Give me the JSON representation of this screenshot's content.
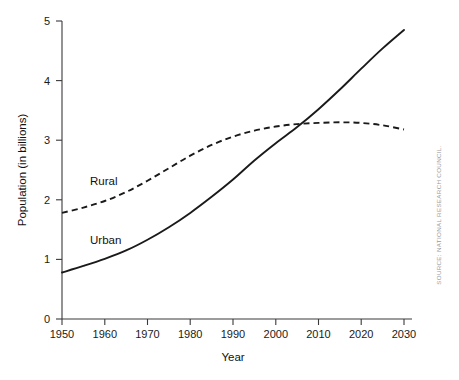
{
  "chart_data": {
    "type": "line",
    "title": "",
    "xlabel": "Year",
    "ylabel": "Population (in billions)",
    "xlim": [
      1950,
      2030
    ],
    "ylim": [
      0,
      5
    ],
    "xticks": [
      1950,
      1960,
      1970,
      1980,
      1990,
      2000,
      2010,
      2020,
      2030
    ],
    "xtick_labels": [
      "1950",
      "1960",
      "1970",
      "1980",
      "1990",
      "2000",
      "2010",
      "2020",
      "2030"
    ],
    "yticks": [
      0,
      1,
      2,
      3,
      4,
      5
    ],
    "ytick_labels": [
      "0",
      "1",
      "2",
      "3",
      "4",
      "5"
    ],
    "grid": false,
    "legend_position": "inline-labels",
    "x": [
      1950,
      1955,
      1960,
      1965,
      1970,
      1975,
      1980,
      1985,
      1990,
      1995,
      2000,
      2005,
      2010,
      2015,
      2020,
      2025,
      2030
    ],
    "series": [
      {
        "name": "Urban",
        "style": "solid",
        "color": "#1a1a1a",
        "values": [
          0.78,
          0.89,
          1.01,
          1.15,
          1.33,
          1.54,
          1.78,
          2.05,
          2.34,
          2.66,
          2.95,
          3.22,
          3.52,
          3.85,
          4.2,
          4.54,
          4.85
        ]
      },
      {
        "name": "Rural",
        "style": "dashed",
        "color": "#1a1a1a",
        "values": [
          1.78,
          1.87,
          1.98,
          2.13,
          2.32,
          2.53,
          2.74,
          2.92,
          3.06,
          3.16,
          3.23,
          3.27,
          3.29,
          3.3,
          3.29,
          3.25,
          3.18
        ]
      }
    ],
    "annotations": [
      {
        "text": "Rural",
        "x": 1960,
        "y": 2.45
      },
      {
        "text": "Urban",
        "x": 1960,
        "y": 1.43
      }
    ],
    "crossover": {
      "year": 2007,
      "value": 3.28
    }
  },
  "figure": {
    "source_note": "SOURCE: NATIONAL RESEARCH COUNCIL.",
    "background_color": "#ffffff",
    "axis_color": "#3a3a3a",
    "line_color": "#1a1a1a",
    "source_color": "#9a9a9a"
  }
}
